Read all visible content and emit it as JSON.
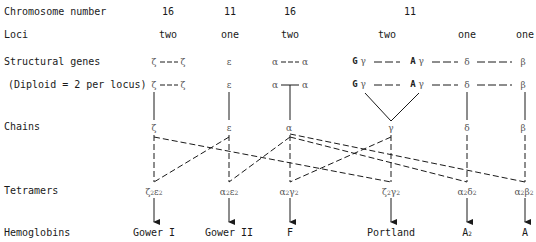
{
  "row_labels": {
    "chromosome_number": "Chromosome number",
    "loci": "Loci",
    "structural_genes": "Structural genes",
    "diploid_note": "(Diploid = 2 per locus)",
    "chains": "Chains",
    "tetramers": "Tetramers",
    "hemoglobins": "Hemoglobins"
  },
  "chromosomes": [
    {
      "number": "16",
      "loci": "two",
      "genes": "ζ — ζ"
    },
    {
      "number": "11",
      "loci": "one",
      "genes": "ε"
    },
    {
      "number": "16",
      "loci": "two",
      "genes": "α — α"
    },
    {
      "number": "11",
      "loci": "two",
      "genes": "Gγ — Aγ"
    },
    {
      "number": "",
      "loci": "one",
      "genes": "δ"
    },
    {
      "number": "",
      "loci": "one",
      "genes": "β"
    }
  ],
  "genes": {
    "zeta": "ζ",
    "epsilon": "ε",
    "alpha": "α",
    "gamma": "γ",
    "delta": "δ",
    "beta": "β",
    "G": "G",
    "A": "A"
  },
  "chains": [
    "ζ",
    "ε",
    "α",
    "γ",
    "δ",
    "β"
  ],
  "tetramers": [
    {
      "a": "ζ",
      "a_sub": "2",
      "b": "ε",
      "b_sub": "2"
    },
    {
      "a": "α",
      "a_sub": "2",
      "b": "ε",
      "b_sub": "2"
    },
    {
      "a": "α",
      "a_sub": "2",
      "b": "γ",
      "b_sub": "2"
    },
    {
      "a": "ζ",
      "a_sub": "2",
      "b": "γ",
      "b_sub": "2"
    },
    {
      "a": "α",
      "a_sub": "2",
      "b": "δ",
      "b_sub": "2"
    },
    {
      "a": "α",
      "a_sub": "2",
      "b": "β",
      "b_sub": "2"
    }
  ],
  "hemoglobins": [
    "Gower I",
    "Gower II",
    "F",
    "Portland",
    "A",
    "A"
  ],
  "hemoglobin_A2_sub": "2",
  "colors": {
    "line": "#1a1a1a",
    "symbol": "#555555"
  }
}
